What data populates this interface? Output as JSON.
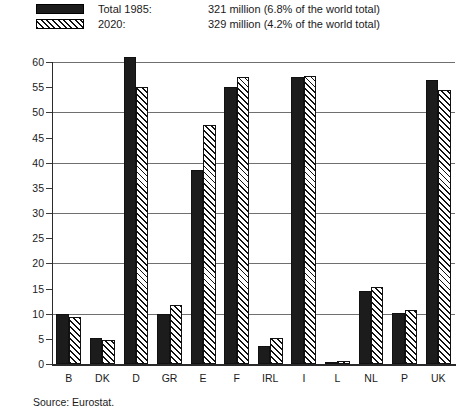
{
  "legend": {
    "rows": [
      {
        "swatch": "solid-black-swatch",
        "label": "Total 1985:",
        "value": "321 million (6.8% of the world total)"
      },
      {
        "swatch": "hatched-swatch",
        "label": "2020:",
        "value": "329 million (4.2% of the world total)"
      }
    ]
  },
  "source": {
    "text": "Source: Eurostat."
  },
  "colors": {
    "series_1985": "#1c1c1c",
    "series_2020": "#ffffff",
    "hatch": "#111111",
    "gridline": "#6f6f6f",
    "axis": "#2a2a2a"
  },
  "chart_data": {
    "type": "bar",
    "title": "",
    "subtitle": "",
    "xlabel": "",
    "ylabel": "",
    "ylim": [
      0,
      60
    ],
    "yticks": [
      0,
      5,
      10,
      15,
      20,
      25,
      30,
      35,
      40,
      45,
      50,
      55,
      60
    ],
    "ytick_labels": [
      "0",
      "5",
      "10",
      "15",
      "20",
      "25",
      "30",
      "35",
      "40",
      "45",
      "50",
      "55",
      "60"
    ],
    "gridlines_at": [
      10,
      20,
      30,
      40,
      50,
      60
    ],
    "grid": true,
    "legend_position": "above-plot",
    "categories": [
      "B",
      "DK",
      "D",
      "GR",
      "E",
      "F",
      "IRL",
      "I",
      "L",
      "NL",
      "P",
      "UK"
    ],
    "series": [
      {
        "name": "Total 1985:",
        "values": [
          9.9,
          5.1,
          61.0,
          9.9,
          38.5,
          55.0,
          3.6,
          57.1,
          0.4,
          14.5,
          10.2,
          56.5
        ]
      },
      {
        "name": "2020:",
        "values": [
          9.3,
          4.8,
          55.0,
          11.7,
          47.5,
          57.0,
          5.2,
          57.3,
          0.5,
          15.3,
          10.8,
          54.4
        ]
      }
    ],
    "annotations": [
      "Source: Eurostat."
    ]
  }
}
